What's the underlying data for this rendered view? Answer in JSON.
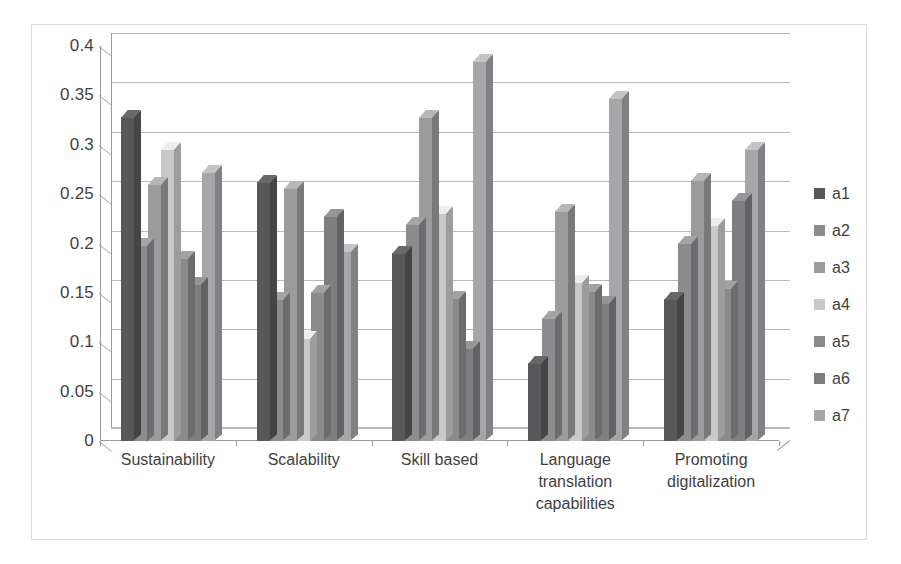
{
  "chart_data": {
    "type": "bar",
    "title": "",
    "subtitle": "",
    "xlabel": "",
    "ylabel": "",
    "ylim": [
      0,
      0.4
    ],
    "yticks": [
      "0",
      "0.05",
      "0.1",
      "0.15",
      "0.2",
      "0.25",
      "0.3",
      "0.35",
      "0.4"
    ],
    "ytick_values": [
      0,
      0.05,
      0.1,
      0.15,
      0.2,
      0.25,
      0.3,
      0.35,
      0.4
    ],
    "grid": true,
    "legend_position": "right",
    "style": "3d-clustered-column-grayscale",
    "categories": [
      "Sustainability",
      "Scalability",
      "Skill based",
      "Language translation capabilities",
      "Promoting digitalization"
    ],
    "category_lines": [
      [
        "Sustainability"
      ],
      [
        "Scalability"
      ],
      [
        "Skill based"
      ],
      [
        "Language",
        "translation",
        "capabilities"
      ],
      [
        "Promoting",
        "digitalization"
      ]
    ],
    "series": [
      {
        "name": "a1",
        "color": "#58585a",
        "values": [
          0.328,
          0.262,
          0.19,
          0.079,
          0.144
        ]
      },
      {
        "name": "a2",
        "color": "#8c8c8e",
        "values": [
          0.199,
          0.144,
          0.22,
          0.125,
          0.201
        ]
      },
      {
        "name": "a3",
        "color": "#9b9b9d",
        "values": [
          0.26,
          0.256,
          0.328,
          0.233,
          0.264
        ]
      },
      {
        "name": "a4",
        "color": "#c9c9cb",
        "values": [
          0.296,
          0.104,
          0.231,
          0.161,
          0.219
        ]
      },
      {
        "name": "a5",
        "color": "#8a8a8c",
        "values": [
          0.185,
          0.151,
          0.145,
          0.152,
          0.155
        ]
      },
      {
        "name": "a6",
        "color": "#7e7e80",
        "values": [
          0.159,
          0.228,
          0.094,
          0.14,
          0.244
        ]
      },
      {
        "name": "a7",
        "color": "#a6a6a8",
        "values": [
          0.272,
          0.192,
          0.385,
          0.347,
          0.296
        ]
      }
    ]
  },
  "legend": {
    "items": [
      {
        "label": "a1"
      },
      {
        "label": "a2"
      },
      {
        "label": "a3"
      },
      {
        "label": "a4"
      },
      {
        "label": "a5"
      },
      {
        "label": "a6"
      },
      {
        "label": "a7"
      }
    ]
  },
  "colors": {
    "gridline": "#b9b9b9",
    "axis": "#9a9a9a",
    "frame_border": "#dcdcdc",
    "text": "#3f3f3f",
    "background": "#ffffff"
  }
}
